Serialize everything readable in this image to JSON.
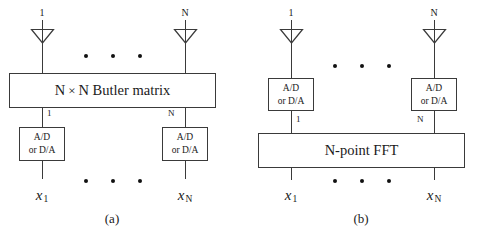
{
  "figure": {
    "background": "#ffffff",
    "line_color": "#3a3a3a",
    "dot_color": "#111111"
  },
  "panel_a": {
    "caption": "(a)",
    "antennas": [
      {
        "port_label": "1",
        "icon": "antenna-triangle-icon"
      },
      {
        "port_label": "N",
        "icon": "antenna-triangle-icon"
      }
    ],
    "top_dots": [
      "dot",
      "dot",
      "dot"
    ],
    "main_block": {
      "label": "N × N Butler matrix",
      "label_part_1": "N",
      "label_times": "×",
      "label_part_2": "N Butler matrix"
    },
    "converters": [
      {
        "line1": "A/D",
        "line2": "or D/A",
        "wire_label": "1"
      },
      {
        "line1": "A/D",
        "line2": "or D/A",
        "wire_label": "N"
      }
    ],
    "bottom_dots": [
      "dot",
      "dot",
      "dot"
    ],
    "signals": [
      {
        "symbol": "x",
        "subscript": "1"
      },
      {
        "symbol": "x",
        "subscript": "N"
      }
    ]
  },
  "panel_b": {
    "caption": "(b)",
    "antennas": [
      {
        "port_label": "1",
        "icon": "antenna-triangle-icon"
      },
      {
        "port_label": "N",
        "icon": "antenna-triangle-icon"
      }
    ],
    "top_dots": [
      "dot",
      "dot",
      "dot"
    ],
    "converters": [
      {
        "line1": "A/D",
        "line2": "or D/A",
        "wire_label": "1"
      },
      {
        "line1": "A/D",
        "line2": "or D/A",
        "wire_label": "N"
      }
    ],
    "main_block": {
      "label": "N-point FFT"
    },
    "bottom_dots": [
      "dot",
      "dot",
      "dot"
    ],
    "signals": [
      {
        "symbol": "x",
        "subscript": "1"
      },
      {
        "symbol": "x",
        "subscript": "N"
      }
    ]
  }
}
